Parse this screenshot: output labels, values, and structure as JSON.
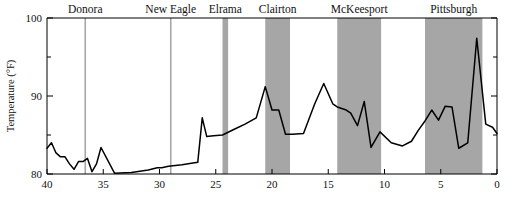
{
  "chart_data": {
    "type": "line",
    "title": "",
    "subtitle": "",
    "xlabel": "",
    "ylabel": "Temperature (°F)",
    "xlim": [
      40,
      0
    ],
    "ylim": [
      80,
      100
    ],
    "x_inverted": true,
    "grid": false,
    "legend": null,
    "y_ticks_major": [
      "80",
      "90",
      "100"
    ],
    "y_ticks_major_values": [
      80,
      90,
      100
    ],
    "y_ticks_minor_values": [
      85,
      95
    ],
    "x_ticks_major": [
      "40",
      "35",
      "30",
      "25",
      "20",
      "15",
      "10",
      "5",
      "0"
    ],
    "x_ticks_major_values": [
      40,
      35,
      30,
      25,
      20,
      15,
      10,
      5,
      0
    ],
    "line_color": "#000000",
    "band_color": "#a6a6a6",
    "marker_line_color": "#a6a6a6",
    "series": [
      {
        "name": "Temperature",
        "x": [
          40.0,
          39.6,
          39.2,
          38.8,
          38.4,
          38.0,
          37.6,
          37.2,
          36.8,
          36.4,
          36.0,
          35.6,
          35.2,
          34.0,
          32.5,
          31.0,
          30.2,
          29.8,
          29.2,
          28.0,
          26.6,
          26.2,
          25.8,
          25.2,
          24.4,
          23.4,
          22.4,
          21.4,
          20.6,
          20.0,
          19.4,
          18.8,
          18.2,
          17.2,
          16.2,
          15.4,
          14.6,
          14.2,
          13.8,
          13.4,
          13.0,
          12.4,
          11.8,
          11.2,
          10.4,
          9.4,
          8.4,
          7.6,
          7.0,
          6.4,
          5.8,
          5.2,
          4.6,
          4.0,
          3.4,
          2.6,
          1.8,
          1.0,
          0.4,
          0.0
        ],
        "y": [
          83.3,
          84.0,
          82.7,
          82.2,
          82.2,
          81.3,
          80.6,
          81.6,
          81.6,
          82.0,
          80.3,
          81.3,
          83.4,
          80.1,
          80.2,
          80.5,
          80.8,
          80.8,
          81.0,
          81.2,
          81.5,
          87.2,
          84.8,
          84.9,
          85.0,
          85.7,
          86.4,
          87.2,
          91.2,
          88.2,
          88.2,
          85.1,
          85.1,
          85.2,
          89.0,
          91.6,
          89.0,
          88.6,
          88.4,
          88.2,
          87.8,
          86.2,
          89.3,
          83.4,
          85.4,
          84.0,
          83.6,
          84.2,
          85.6,
          86.8,
          88.2,
          86.9,
          88.7,
          88.6,
          83.3,
          84.0,
          97.4,
          86.4,
          86.0,
          85.2
        ]
      }
    ],
    "markers": [
      {
        "label": "Donora",
        "type": "line",
        "x": 36.6
      },
      {
        "label": "New Eagle",
        "type": "line",
        "x": 29.0
      },
      {
        "label": "Elrama",
        "type": "band",
        "x_start": 24.4,
        "x_end": 23.9
      },
      {
        "label": "Clairton",
        "type": "band",
        "x_start": 20.6,
        "x_end": 18.4
      },
      {
        "label": "McKeesport",
        "type": "band",
        "x_start": 14.2,
        "x_end": 10.3
      },
      {
        "label": "Pittsburgh",
        "type": "band",
        "x_start": 6.4,
        "x_end": 1.3
      }
    ]
  },
  "axes": {
    "y_label": "Temperature (°F)"
  }
}
